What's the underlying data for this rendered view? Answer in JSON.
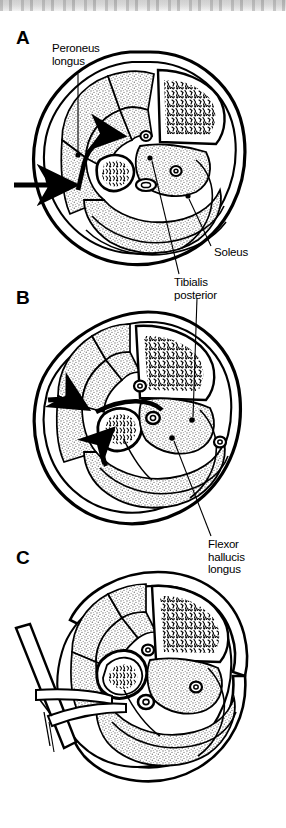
{
  "figure": {
    "type": "anatomical-cross-section-series",
    "panel_count": 3,
    "background_color": "#ffffff",
    "ink_color": "#000000",
    "stipple_color": "#9a9a9a",
    "scanbar_color": "#cfcfcf"
  },
  "panels": [
    {
      "id": "A",
      "letter": "A",
      "caption_position": "top-left",
      "description": "Transverse section of leg with intact fascia; curved arrow indicates plane of dissection between peroneus longus and soleus.",
      "instrument": "arrow-pointer",
      "bones": [
        "tibia",
        "fibula"
      ]
    },
    {
      "id": "B",
      "letter": "B",
      "caption_position": "top-left",
      "description": "Deeper dissection; arrow shows elevation of flexor hallucis longus off the fibula.",
      "instrument": "arrow-pointer",
      "bones": [
        "tibia",
        "fibula"
      ]
    },
    {
      "id": "C",
      "letter": "C",
      "caption_position": "top-left",
      "description": "Completed exposure with retractor in place holding the fibula and soft tissues.",
      "instrument": "retractor",
      "bones": [
        "tibia",
        "fibula"
      ]
    }
  ],
  "labels": [
    {
      "id": "peroneus-longus",
      "text": "Peroneus\nlongus",
      "line1": "Peroneus",
      "line2": "longus",
      "panel": "A",
      "text_x": 52,
      "text_y": 48,
      "leader_from": [
        78,
        75
      ],
      "leader_to": [
        78,
        155
      ],
      "point_x": 78,
      "point_y": 155
    },
    {
      "id": "soleus",
      "text": "Soleus",
      "line1": "Soleus",
      "line2": "",
      "panel": "A",
      "text_x": 214,
      "text_y": 252,
      "leader_from": [
        212,
        248
      ],
      "leader_to": [
        188,
        196
      ],
      "point_x": 188,
      "point_y": 196
    },
    {
      "id": "tibialis-posterior",
      "text": "Tibialis\nposterior",
      "line1": "Tibialis",
      "line2": "posterior",
      "panel": "A",
      "text_x": 175,
      "text_y": 282,
      "leader_from": [
        180,
        276
      ],
      "leader_to": [
        150,
        158
      ],
      "point_x": 150,
      "point_y": 158
    },
    {
      "id": "flexor-hallucis-longus",
      "text": "Flexor\nhallucis\nlongus",
      "line1": "Flexor",
      "line2": "hallucis",
      "line3": "longus",
      "panel": "B",
      "text_x": 208,
      "text_y": 544,
      "leader_from": [
        212,
        538
      ],
      "leader_to": [
        172,
        438
      ],
      "point_x": 172,
      "point_y": 438
    },
    {
      "id": "tibialis-posterior-b",
      "text": "Tibialis\nposterior",
      "line1": "Tibialis",
      "line2": "posterior",
      "panel": "B",
      "note": "second leader into panel B compartment",
      "leader_from": [
        198,
        296
      ],
      "leader_to": [
        192,
        420
      ],
      "point_x": 192,
      "point_y": 420
    }
  ],
  "annotations": {
    "arrow_a": {
      "name": "dissection-arrow-a",
      "tail_x": 14,
      "tail_y": 185,
      "tip_x": 80,
      "tip_y": 185
    },
    "arrow_a_curved": {
      "name": "curved-dissection-arrow-a",
      "tip_x": 118,
      "tip_y": 143
    },
    "arrow_b": {
      "name": "dissection-arrow-b",
      "tail_x": 48,
      "tail_y": 402,
      "tip_x": 92,
      "tip_y": 408
    },
    "arrow_b_curved": {
      "name": "curved-elevation-arrow-b",
      "tip_x": 110,
      "tip_y": 432
    },
    "retractor_c": {
      "name": "surgical-retractor",
      "handle_top_x": 22,
      "handle_top_y": 628,
      "handle_bottom_x": 80,
      "handle_bottom_y": 748
    }
  }
}
